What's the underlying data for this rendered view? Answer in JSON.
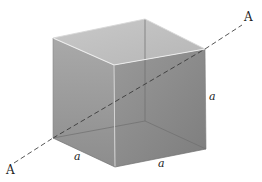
{
  "figure": {
    "axis_labels": {
      "start": "A",
      "end": "A"
    },
    "edge_labels": {
      "left_bottom_edge": "a",
      "front_bottom_edge": "a",
      "right_vertical_edge": "a"
    },
    "colors": {
      "background": "#ffffff",
      "top_face": "#c4c4c4",
      "left_face": "#9e9e9e",
      "right_face": "#8a8a8a",
      "edge_highlight": "#e6e6e6",
      "hidden_edge": "#6e6e6e",
      "axis_dash": "#444444"
    },
    "vertices": {
      "left_top": [
        53,
        38
      ],
      "back_top": [
        145,
        19
      ],
      "front_top": [
        114,
        65
      ],
      "right_top": [
        205,
        49
      ],
      "left_bottom": [
        53,
        138
      ],
      "front_bottom": [
        115,
        167
      ],
      "right_bottom": [
        206,
        149
      ],
      "back_bottom": [
        145,
        121
      ]
    }
  }
}
